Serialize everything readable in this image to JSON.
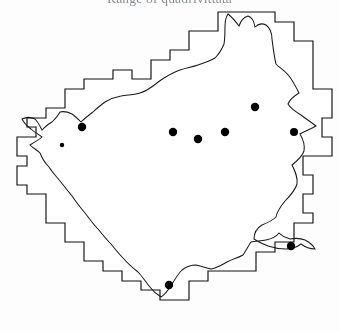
{
  "figure": {
    "title": "Range of quadrivittata",
    "title_visible_fragment": "rangc quad",
    "caption": "",
    "type": "distribution-range-map"
  },
  "map": {
    "name": "gridded-distribution-map",
    "description": "Black-and-white scanned range map: a region boundary drawn over a UTM-style sampling grid, with filled circles marking recorded occurrences.",
    "colors": {
      "background": "#ffffff",
      "grid_fine": "#2b2b2b",
      "grid_coarse": "#0b0b0b",
      "outline": "#1a1a1a",
      "marker": "#000000"
    },
    "grid": {
      "fine_cell_px": 9.6,
      "coarse_every_n_cells": 3,
      "origin_x": 16,
      "origin_y": 6,
      "cols": 33,
      "rows": 32
    },
    "markers_label": "occurrence record",
    "marker_count": 9,
    "markers": [
      {
        "id": "record-1",
        "x": 82,
        "y": 121,
        "r": 4.2
      },
      {
        "id": "record-2",
        "x": 255,
        "y": 101,
        "r": 4.2
      },
      {
        "id": "record-3",
        "x": 173,
        "y": 126,
        "r": 4.2
      },
      {
        "id": "record-4",
        "x": 225,
        "y": 126,
        "r": 4.2
      },
      {
        "id": "record-5",
        "x": 198,
        "y": 133,
        "r": 4.2
      },
      {
        "id": "record-6",
        "x": 294,
        "y": 126,
        "r": 4.0
      },
      {
        "id": "record-7",
        "x": 291,
        "y": 240,
        "r": 4.2
      },
      {
        "id": "record-8",
        "x": 169,
        "y": 279,
        "r": 4.2
      },
      {
        "id": "record-9",
        "x": 62,
        "y": 139,
        "r": 2.2
      }
    ]
  }
}
